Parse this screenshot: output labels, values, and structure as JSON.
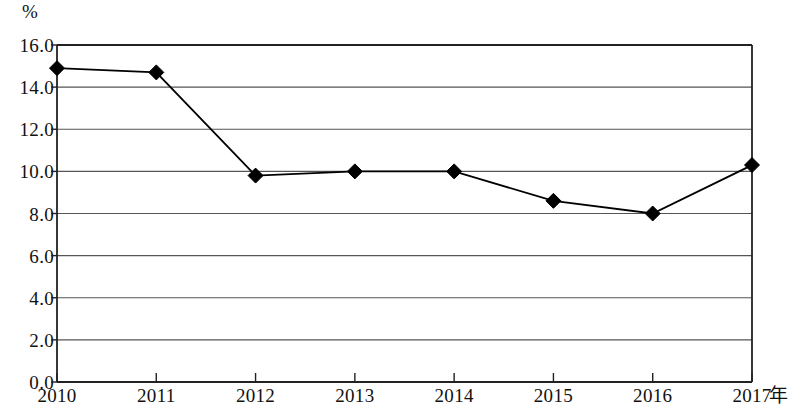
{
  "chart_data": {
    "type": "line",
    "title": "",
    "subtitle": "",
    "xlabel": "年",
    "ylabel": "%",
    "categories": [
      "2010",
      "2011",
      "2012",
      "2013",
      "2014",
      "2015",
      "2016",
      "2017"
    ],
    "values": [
      14.9,
      14.7,
      9.8,
      10.0,
      10.0,
      8.6,
      8.0,
      10.3
    ],
    "series": [
      {
        "name": "",
        "values": [
          14.9,
          14.7,
          9.8,
          10.0,
          10.0,
          8.6,
          8.0,
          10.3
        ]
      }
    ],
    "ylim": [
      0.0,
      16.0
    ],
    "ytick_labels": [
      "16.0",
      "14.0",
      "12.0",
      "10.0",
      "8.0",
      "6.0",
      "4.0",
      "2.0",
      "0.0"
    ],
    "ytick_values": [
      16.0,
      14.0,
      12.0,
      10.0,
      8.0,
      6.0,
      4.0,
      2.0,
      0.0
    ],
    "xtick_labels": [
      "2010",
      "2011",
      "2012",
      "2013",
      "2014",
      "2015",
      "2016",
      "2017"
    ],
    "grid": "horizontal",
    "legend": "none",
    "marker": "diamond",
    "line_color": "#000000",
    "marker_color": "#000000",
    "grid_color": "#555555",
    "axis_color": "#222222",
    "background_color": "#ffffff"
  }
}
